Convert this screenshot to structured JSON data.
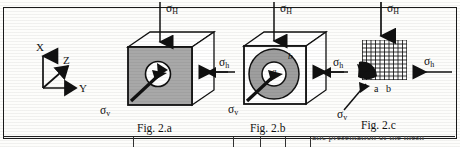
{
  "figure": {
    "type": "technical-diagram",
    "axes": {
      "x_label": "X",
      "y_label": "Y",
      "z_label": "Z"
    },
    "stress_labels": {
      "horizontal_major": "σ",
      "horizontal_major_sub": "H",
      "horizontal_minor": "σ",
      "horizontal_minor_sub": "h",
      "vertical": "σ",
      "vertical_sub": "v"
    },
    "panels": [
      {
        "id": "fig-2a",
        "caption": "Fig. 2.a",
        "face_fill": "#a8a8a8",
        "top_arrow_label": "σH",
        "right_arrow_label": "σh",
        "lower_left_arrow_label": "σv",
        "inclusion": "white-circle-with-arrow",
        "annotations": []
      },
      {
        "id": "fig-2b",
        "caption": "Fig. 2.b",
        "face_fill": "#ffffff",
        "annulus_fill": "#9e9e9e",
        "top_arrow_label": "σH",
        "right_arrow_label": "σh",
        "left_arrow_label": "σh",
        "lower_left_arrow_label": "σv",
        "inclusion": "gray-annulus-with-inner-white-circle",
        "annotations": [
          "a",
          "b"
        ]
      },
      {
        "id": "fig-2c",
        "caption": "Fig. 2.c",
        "mesh": "quarter-symmetry-grid",
        "mesh_rows": 10,
        "mesh_cols": 10,
        "top_arrow_label": "σH",
        "right_arrow_label": "σh",
        "left_arrow_label": "σh",
        "lower_left_arrow_label": "σv",
        "annotations": [
          "a",
          "b"
        ]
      }
    ],
    "bottom_caption_fragment": "atic presentation of the mesh"
  }
}
